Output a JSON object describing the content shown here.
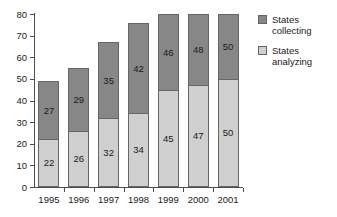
{
  "chart_data": {
    "type": "bar",
    "stacked": true,
    "title": "",
    "subtitle": "",
    "xlabel": "",
    "ylabel": "",
    "categories": [
      "1995",
      "1996",
      "1997",
      "1998",
      "1999",
      "2000",
      "2001"
    ],
    "series": [
      {
        "name": "States analyzing",
        "color": "#cfcfcf",
        "values": [
          22,
          26,
          32,
          34,
          45,
          47,
          50
        ]
      },
      {
        "name": "States collecting",
        "color": "#878787",
        "values": [
          27,
          29,
          35,
          42,
          46,
          48,
          50
        ]
      }
    ],
    "stack_order_bottom_to_top": [
      "States analyzing",
      "States collecting"
    ],
    "bar_tops": [
      49,
      55,
      67,
      76,
      80,
      80,
      80
    ],
    "ylim": [
      0,
      80
    ],
    "yticks": [
      0,
      10,
      20,
      30,
      40,
      50,
      60,
      70,
      80
    ],
    "ytick_labels": [
      "0",
      "10",
      "20",
      "30",
      "40",
      "50",
      "60",
      "70",
      "80"
    ],
    "grid": false,
    "legend_position": "right",
    "legend": [
      {
        "label": "States\ncollecting",
        "color": "#878787"
      },
      {
        "label": "States\nanalyzing",
        "color": "#cfcfcf"
      }
    ]
  },
  "colors": {
    "background": "#ffffff",
    "axis": "#4d4d4d",
    "bar_outline": "#666666",
    "series_collecting": "#878787",
    "series_analyzing": "#cfcfcf",
    "text": "#1a1a1a"
  }
}
